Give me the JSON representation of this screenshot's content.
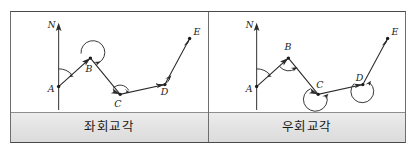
{
  "figure": {
    "panels": [
      {
        "id": "left-deflection",
        "caption": "좌회교각",
        "north_label": "N",
        "vertices": [
          {
            "label": "A",
            "x": 48,
            "y": 76
          },
          {
            "label": "B",
            "x": 80,
            "y": 47
          },
          {
            "label": "C",
            "x": 110,
            "y": 84
          },
          {
            "label": "D",
            "x": 155,
            "y": 74
          },
          {
            "label": "E",
            "x": 180,
            "y": 27
          }
        ],
        "angle_marks": [
          {
            "at": "A",
            "kind": "small-arc",
            "side": "right-of-north"
          },
          {
            "at": "B",
            "kind": "reflex-arc",
            "side": "above"
          },
          {
            "at": "C",
            "kind": "small-arc",
            "side": "above-right"
          },
          {
            "at": "D",
            "kind": "small-arc",
            "side": "above-left"
          }
        ]
      },
      {
        "id": "right-deflection",
        "caption": "우회교각",
        "north_label": "N",
        "vertices": [
          {
            "label": "A",
            "x": 48,
            "y": 76
          },
          {
            "label": "B",
            "x": 80,
            "y": 47
          },
          {
            "label": "C",
            "x": 110,
            "y": 84
          },
          {
            "label": "D",
            "x": 155,
            "y": 74
          },
          {
            "label": "E",
            "x": 180,
            "y": 27
          }
        ],
        "angle_marks": [
          {
            "at": "A",
            "kind": "small-arc",
            "side": "right-of-north"
          },
          {
            "at": "B",
            "kind": "small-arc",
            "side": "below"
          },
          {
            "at": "C",
            "kind": "reflex-arc",
            "side": "below"
          },
          {
            "at": "D",
            "kind": "reflex-arc",
            "side": "below"
          }
        ]
      }
    ],
    "colors": {
      "line": "#2b2b2b",
      "caption_background": "#e3e3e3",
      "border": "#4a4a4a",
      "page_background": "#ffffff"
    }
  }
}
